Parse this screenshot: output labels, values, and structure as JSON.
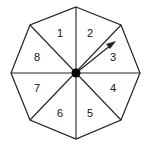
{
  "diagram": {
    "type": "spinner",
    "shape": "octagon",
    "sections": [
      "1",
      "2",
      "3",
      "4",
      "5",
      "6",
      "7",
      "8"
    ],
    "arrow_points_to_section": "3",
    "colors": {
      "stroke": "#222222",
      "fill": "#ffffff",
      "pivot": "#000000",
      "arrow": "#222222"
    }
  }
}
